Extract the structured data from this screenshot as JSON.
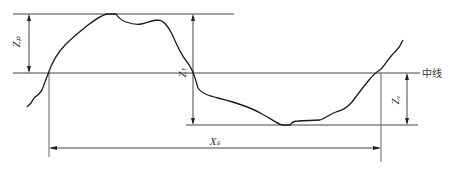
{
  "diagram": {
    "labels": {
      "zp": "Zₚ",
      "zt": "Zₜ",
      "zv": "Zᵥ",
      "xs": "Xₛ",
      "mean_line": "中线"
    },
    "colors": {
      "line": "#1a1a1a",
      "guide": "#555555",
      "background": "#ffffff"
    }
  }
}
